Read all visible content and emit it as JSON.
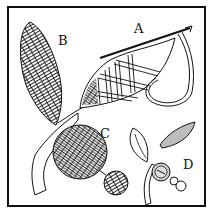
{
  "illustration": {
    "subject": "embroidery stitch examples",
    "labels": {
      "a": "A",
      "b": "B",
      "c": "C",
      "d": "D"
    },
    "colors": {
      "ink": "#111111",
      "paper": "#ffffff",
      "shade": "#bdbdbd"
    }
  }
}
